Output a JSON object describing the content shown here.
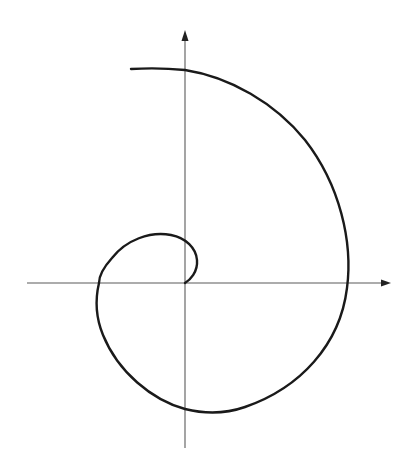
{
  "diagram": {
    "type": "spiral on cartesian axes",
    "background_color": "#ffffff",
    "axis_color": "#5a5a5a",
    "curve_color": "#1a1a1a",
    "origin": [
      185,
      283
    ],
    "x_axis": {
      "from": [
        27,
        283
      ],
      "to": [
        390,
        283
      ],
      "arrow": "right"
    },
    "y_axis": {
      "from": [
        185,
        448
      ],
      "to": [
        185,
        31
      ],
      "arrow": "up"
    },
    "spiral": {
      "direction": "counter-clockwise outward from origin",
      "start": [
        185,
        283
      ],
      "end": [
        131,
        69
      ],
      "axis_crossings": {
        "negative_x": [
          100,
          283
        ],
        "negative_y": [
          185,
          409
        ],
        "positive_x": [
          347,
          283
        ],
        "positive_y": [
          185,
          70
        ]
      }
    },
    "labels": []
  }
}
